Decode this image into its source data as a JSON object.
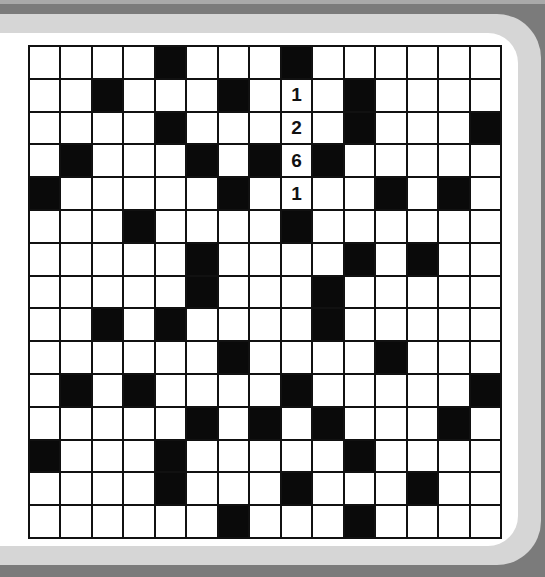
{
  "puzzle": {
    "type": "crossword-fill-in",
    "rows": 15,
    "cols": 15,
    "black_cells": [
      [
        4,
        8
      ],
      [
        2,
        6,
        10
      ],
      [
        4,
        10,
        14
      ],
      [
        1,
        5,
        7,
        9
      ],
      [
        0,
        6,
        11,
        13
      ],
      [
        3,
        8
      ],
      [
        5,
        10,
        12
      ],
      [
        5,
        9
      ],
      [
        2,
        4,
        9
      ],
      [
        6,
        11
      ],
      [
        1,
        3,
        8,
        14
      ],
      [
        5,
        7,
        9,
        13
      ],
      [
        0,
        4,
        10
      ],
      [
        4,
        8,
        12
      ],
      [
        6,
        10
      ]
    ],
    "given_entries": [
      {
        "row": 1,
        "col": 8,
        "value": "1"
      },
      {
        "row": 2,
        "col": 8,
        "value": "2"
      },
      {
        "row": 3,
        "col": 8,
        "value": "6"
      },
      {
        "row": 4,
        "col": 8,
        "value": "1"
      }
    ]
  },
  "colors": {
    "outer_border": "#7b7b7b",
    "frame_band": "#d6d6d6",
    "panel": "#ffffff",
    "black_cell": "#0a0a0a",
    "grid_line": "#111111"
  }
}
